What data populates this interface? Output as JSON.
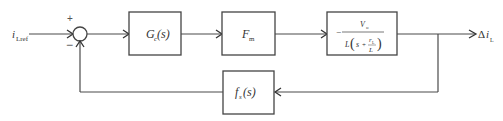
{
  "diagram": {
    "type": "control-loop-block-diagram",
    "input": {
      "symbol": "i",
      "subscript": "Lref"
    },
    "output": {
      "prefix": "Δ",
      "symbol": "i",
      "subscript": "L"
    },
    "summing_junction": {
      "plus_sign": "+",
      "minus_sign": "−"
    },
    "blocks": [
      {
        "id": "controller",
        "symbol": "G",
        "subscript": "c",
        "arg": "(s)"
      },
      {
        "id": "modulator",
        "symbol": "F",
        "subscript": "m",
        "arg": ""
      },
      {
        "id": "plant",
        "sign": "−",
        "numerator": {
          "symbol": "V",
          "subscript": "o"
        },
        "denominator": {
          "lead": "L",
          "open": "(",
          "s": "s",
          "plus": "+",
          "inner_num": {
            "symbol": "r",
            "subscript": "L"
          },
          "inner_den": "L",
          "close": ")"
        }
      },
      {
        "id": "feedback",
        "symbol": "f",
        "subscript": "s",
        "arg": "(s)"
      }
    ]
  }
}
